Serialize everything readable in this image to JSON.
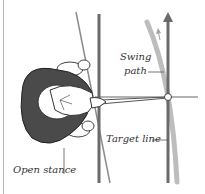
{
  "diagram": {
    "labels": {
      "swing_path_line1": "Swing",
      "swing_path_line2": "path",
      "target_line": "Target line",
      "open_stance": "Open stance"
    },
    "colors": {
      "target_lines": "#6a6a6a",
      "swing_path": "#a9a9a9",
      "body": "#4a4a4a",
      "outline": "#333333"
    }
  }
}
